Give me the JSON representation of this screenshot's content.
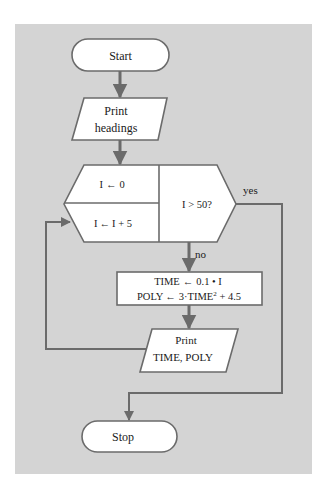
{
  "diagram": {
    "type": "flowchart",
    "colors": {
      "page_background": "#ffffff",
      "panel_background": "#d4d4d4",
      "shape_fill": "#ffffff",
      "stroke": "#6b6b6b",
      "text": "#1a1a1a"
    },
    "nodes": {
      "start": {
        "kind": "terminal",
        "label": "Start"
      },
      "print_headings": {
        "kind": "io",
        "lines": [
          "Print",
          "headings"
        ]
      },
      "loop": {
        "kind": "loop-hexagon",
        "init": {
          "var": "I",
          "arrow": "←",
          "value": "0"
        },
        "increment": {
          "var": "I",
          "arrow": "←",
          "value": "I + 5"
        },
        "test": "I > 50?"
      },
      "compute": {
        "kind": "process",
        "lines": [
          {
            "lhs": "TIME",
            "arrow": "←",
            "rhs": "0.1 • I"
          },
          {
            "lhs": "POLY",
            "arrow": "←",
            "rhs_pre": "3·TIME",
            "rhs_sup": "2",
            "rhs_post": " + 4.5"
          }
        ]
      },
      "print_output": {
        "kind": "io",
        "lines": [
          "Print",
          "TIME, POLY"
        ]
      },
      "stop": {
        "kind": "terminal",
        "label": "Stop"
      }
    },
    "edges": {
      "yes_label": "yes",
      "no_label": "no"
    }
  }
}
